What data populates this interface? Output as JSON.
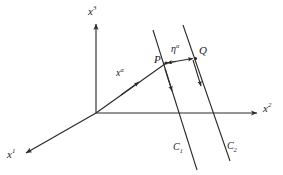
{
  "figure": {
    "background_color": "#ffffff",
    "stroke_color": "#2b2b2b",
    "label_color": "#1a1a1a"
  },
  "axes": {
    "origin": {
      "x": 96,
      "y": 113
    },
    "items": [
      {
        "name": "x3-axis",
        "label_base": "x",
        "label_sup": "3",
        "label_text": "x3",
        "direction": "up",
        "start": {
          "x": 96,
          "y": 113
        },
        "end": {
          "x": 96,
          "y": 22
        },
        "label_pos": {
          "x": 88,
          "y": 6
        }
      },
      {
        "name": "x2-axis",
        "label_base": "x",
        "label_sup": "2",
        "label_text": "x2",
        "direction": "right",
        "start": {
          "x": 96,
          "y": 113
        },
        "end": {
          "x": 259,
          "y": 113
        },
        "label_pos": {
          "x": 263,
          "y": 104
        }
      },
      {
        "name": "x1-axis",
        "label_base": "x",
        "label_sup": "1",
        "label_text": "x1",
        "direction": "down-left",
        "start": {
          "x": 96,
          "y": 113
        },
        "end": {
          "x": 24,
          "y": 154
        },
        "label_pos": {
          "x": 8,
          "y": 150
        }
      }
    ]
  },
  "vectors": [
    {
      "name": "position-vector",
      "label_base": "x",
      "label_sup": "α",
      "label_text": "xα",
      "from": {
        "x": 96,
        "y": 113
      },
      "to": {
        "x": 166,
        "y": 63
      },
      "arrow_at": {
        "x": 135,
        "y": 85
      },
      "label_pos": {
        "x": 117,
        "y": 69
      }
    },
    {
      "name": "deviation-vector",
      "label_base": "η",
      "label_sup": "α",
      "label_text": "ηα",
      "from": {
        "x": 166,
        "y": 63
      },
      "to": {
        "x": 196,
        "y": 58
      },
      "label_pos": {
        "x": 172,
        "y": 45
      }
    }
  ],
  "points": [
    {
      "name": "point-P",
      "label": "P",
      "at": {
        "x": 166,
        "y": 63
      },
      "label_pos": {
        "x": 155,
        "y": 57
      }
    },
    {
      "name": "point-Q",
      "label": "Q",
      "at": {
        "x": 196,
        "y": 58
      },
      "label_pos": {
        "x": 199,
        "y": 48
      }
    }
  ],
  "curves": [
    {
      "name": "curve-C1",
      "label_base": "C",
      "label_sub": "1",
      "label_text": "C1",
      "start": {
        "x": 153,
        "y": 30
      },
      "end": {
        "x": 197,
        "y": 170
      },
      "direction": "downward",
      "arrow_at": {
        "x": 171,
        "y": 88
      },
      "label_pos": {
        "x": 174,
        "y": 143
      }
    },
    {
      "name": "curve-C2",
      "label_base": "C",
      "label_sub": "2",
      "label_text": "C2",
      "start": {
        "x": 183,
        "y": 25
      },
      "end": {
        "x": 230,
        "y": 160
      },
      "direction": "downward",
      "arrow_at": {
        "x": 199,
        "y": 83
      },
      "label_pos": {
        "x": 228,
        "y": 142
      }
    }
  ]
}
